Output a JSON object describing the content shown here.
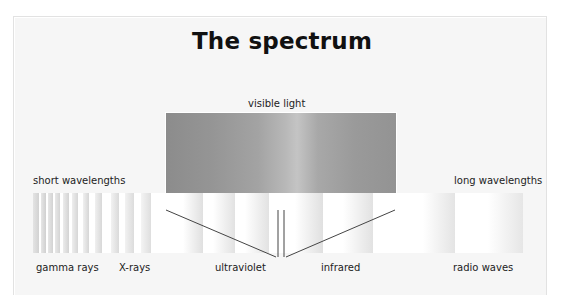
{
  "title": "The spectrum",
  "labels": {
    "visible_light": "visible light",
    "short_wavelengths": "short wavelengths",
    "long_wavelengths": "long wavelengths"
  },
  "bands": [
    {
      "name": "gamma rays"
    },
    {
      "name": "X-rays"
    },
    {
      "name": "ultraviolet"
    },
    {
      "name": "infrared"
    },
    {
      "name": "radio waves"
    }
  ],
  "colors": {
    "panel_bg": "#f6f6f6",
    "visible_box_dark": "#8c8c8c",
    "visible_box_light": "#c4c4c4",
    "line": "#444444"
  }
}
